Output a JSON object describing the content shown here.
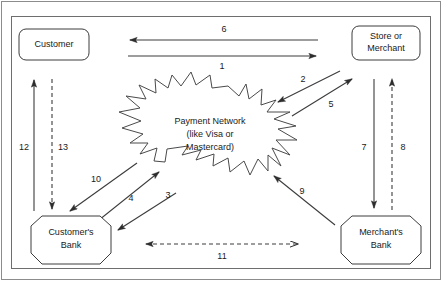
{
  "diagram": {
    "type": "flow-diagram",
    "background_color": "#ffffff",
    "line_color": "#3c3c3c",
    "frame_color": "#8c8c8c",
    "nodes": [
      {
        "id": "customer",
        "label": "Customer",
        "shape": "rounded-rectangle",
        "lines": [
          "Customer"
        ]
      },
      {
        "id": "store-merchant",
        "label": "Store or Merchant",
        "shape": "rounded-rectangle",
        "lines": [
          "Store or",
          "Merchant"
        ]
      },
      {
        "id": "payment-network",
        "label": "Payment Network (like Visa or Mastercard)",
        "shape": "starburst",
        "lines": [
          "Payment Network",
          "(like Visa or",
          "Mastercard)"
        ]
      },
      {
        "id": "customers-bank",
        "label": "Customer's Bank",
        "shape": "octagon",
        "lines": [
          "Customer's",
          "Bank"
        ]
      },
      {
        "id": "merchants-bank",
        "label": "Merchant's Bank",
        "shape": "octagon",
        "lines": [
          "Merchant's",
          "Bank"
        ]
      }
    ],
    "connectors": [
      {
        "id": "c1",
        "label": "1",
        "from": "customer",
        "to": "store-merchant",
        "style": "solid",
        "direction": "forward"
      },
      {
        "id": "c2",
        "label": "2",
        "from": "store-merchant",
        "to": "payment-network",
        "style": "solid",
        "direction": "forward"
      },
      {
        "id": "c3",
        "label": "3",
        "from": "payment-network",
        "to": "customers-bank",
        "style": "solid",
        "direction": "forward"
      },
      {
        "id": "c4",
        "label": "4",
        "from": "customers-bank",
        "to": "payment-network",
        "style": "solid",
        "direction": "forward"
      },
      {
        "id": "c5",
        "label": "5",
        "from": "payment-network",
        "to": "store-merchant",
        "style": "solid",
        "direction": "forward"
      },
      {
        "id": "c6",
        "label": "6",
        "from": "store-merchant",
        "to": "customer",
        "style": "solid",
        "direction": "forward"
      },
      {
        "id": "c7",
        "label": "7",
        "from": "store-merchant",
        "to": "merchants-bank",
        "style": "solid",
        "direction": "forward"
      },
      {
        "id": "c8",
        "label": "8",
        "from": "merchants-bank",
        "to": "store-merchant",
        "style": "dashed",
        "direction": "forward"
      },
      {
        "id": "c9",
        "label": "9",
        "from": "merchants-bank",
        "to": "payment-network",
        "style": "solid",
        "direction": "forward"
      },
      {
        "id": "c10",
        "label": "10",
        "from": "payment-network",
        "to": "customers-bank",
        "style": "solid",
        "direction": "forward"
      },
      {
        "id": "c11",
        "label": "11",
        "from": "customers-bank",
        "to": "merchants-bank",
        "style": "dashed",
        "direction": "both"
      },
      {
        "id": "c12",
        "label": "12",
        "from": "customers-bank",
        "to": "customer",
        "style": "solid",
        "direction": "forward"
      },
      {
        "id": "c13",
        "label": "13",
        "from": "customer",
        "to": "customers-bank",
        "style": "dashed",
        "direction": "forward"
      }
    ]
  }
}
